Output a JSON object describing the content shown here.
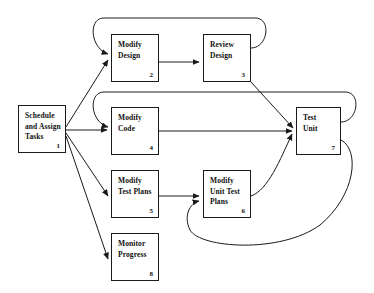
{
  "diagram": {
    "background_color": "#ffffff",
    "line_color": "#1a1a1a",
    "nodes": [
      {
        "id": "n1",
        "number": "1",
        "label": "Schedule\nand Assign\nTasks",
        "x": 18,
        "y": 105,
        "width": 48,
        "height": 48
      },
      {
        "id": "n2",
        "number": "2",
        "label": "Modify\nDesign",
        "x": 111,
        "y": 34,
        "width": 48,
        "height": 48
      },
      {
        "id": "n3",
        "number": "3",
        "label": "Review\nDesign",
        "x": 203,
        "y": 34,
        "width": 48,
        "height": 48
      },
      {
        "id": "n4",
        "number": "4",
        "label": "Modify\nCode",
        "x": 111,
        "y": 107,
        "width": 48,
        "height": 48
      },
      {
        "id": "n5",
        "number": "5",
        "label": "Modify\nTest Plans",
        "x": 111,
        "y": 170,
        "width": 48,
        "height": 48
      },
      {
        "id": "n6",
        "number": "6",
        "label": "Modify\nUnit Test\nPlans",
        "x": 203,
        "y": 170,
        "width": 48,
        "height": 48
      },
      {
        "id": "n7",
        "number": "7",
        "label": "Test\nUnit",
        "x": 296,
        "y": 107,
        "width": 45,
        "height": 48
      },
      {
        "id": "n8",
        "number": "8",
        "label": "Monitor\nProgress",
        "x": 111,
        "y": 233,
        "width": 48,
        "height": 48
      }
    ],
    "edges": [
      {
        "id": "e1",
        "from": "n1",
        "to": "n2",
        "kind": "straight-arrow"
      },
      {
        "id": "e2",
        "from": "n1",
        "to": "n4",
        "kind": "straight-arrow"
      },
      {
        "id": "e3",
        "from": "n1",
        "to": "n5",
        "kind": "straight-arrow"
      },
      {
        "id": "e4",
        "from": "n1",
        "to": "n8",
        "kind": "straight-arrow"
      },
      {
        "id": "e5",
        "from": "n2",
        "to": "n3",
        "kind": "straight-arrow"
      },
      {
        "id": "e6",
        "from": "n3",
        "to": "n7",
        "kind": "straight-arrow"
      },
      {
        "id": "e7",
        "from": "n4",
        "to": "n7",
        "kind": "straight-arrow"
      },
      {
        "id": "e8",
        "from": "n5",
        "to": "n6",
        "kind": "straight-arrow"
      },
      {
        "id": "e9",
        "from": "n6",
        "to": "n7",
        "kind": "straight-arrow"
      },
      {
        "id": "e10",
        "from": "n3",
        "to": "n2",
        "kind": "feedback-loop-top"
      },
      {
        "id": "e11",
        "from": "n7",
        "to": "n4",
        "kind": "feedback-loop-middle"
      },
      {
        "id": "e12",
        "from": "n7",
        "to": "n6",
        "kind": "feedback-loop-bottom"
      }
    ]
  }
}
